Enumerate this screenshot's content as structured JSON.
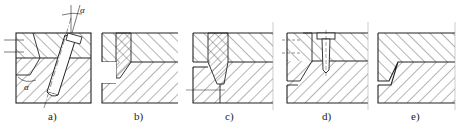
{
  "figure": {
    "type": "engineering-section-drawings",
    "panels": [
      {
        "id": "a",
        "label": "a)",
        "annotations": [
          "α",
          "α"
        ],
        "feature": "inclined-pin"
      },
      {
        "id": "b",
        "label": "b)",
        "feature": "stepped-insert"
      },
      {
        "id": "c",
        "label": "c)",
        "feature": "tapered-insert"
      },
      {
        "id": "d",
        "label": "d)",
        "feature": "screw-fastened-insert"
      },
      {
        "id": "e",
        "label": "e)",
        "feature": "chamfered-parting-line"
      }
    ],
    "angle_symbol": "α",
    "caption": "· · · · · · ·",
    "colors": {
      "line": "#222222",
      "hatch": "#444444",
      "background": "#ffffff"
    }
  }
}
